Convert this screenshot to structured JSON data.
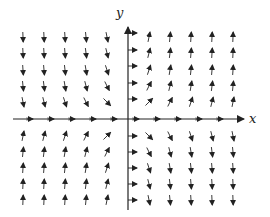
{
  "diagram": {
    "type": "vector-field",
    "axes": {
      "x_label": "x",
      "y_label": "y",
      "origin_px": [
        128,
        119
      ],
      "x_range_px": [
        13,
        244
      ],
      "y_range_px": [
        27,
        210
      ],
      "color": "#222222"
    },
    "grid": {
      "columns_px": [
        23,
        44,
        65,
        86,
        107,
        149,
        170,
        191,
        212,
        233
      ],
      "rows_px": [
        37,
        53,
        70,
        86,
        102,
        136,
        152,
        168,
        184,
        200
      ],
      "column_index_values": [
        -5,
        -4,
        -3,
        -2,
        -1,
        1,
        2,
        3,
        4,
        5
      ],
      "row_index_values": [
        5,
        4,
        3,
        2,
        1,
        -1,
        -2,
        -3,
        -4,
        -5
      ]
    },
    "field_description": "Arrows point right on the axes; upward in quadrants I and III, downward in quadrants II and IV; arrows near axes tilt toward the right",
    "axis_arrows": {
      "x_axis_ticks_px": [
        32,
        53,
        74,
        95,
        116,
        138,
        159,
        180,
        201,
        222
      ],
      "y_axis_ticks_px": [
        33,
        50,
        66,
        83,
        99,
        136,
        152,
        168,
        184,
        200
      ]
    },
    "arrow_length_px": 10,
    "arrow_color": "#222222"
  }
}
